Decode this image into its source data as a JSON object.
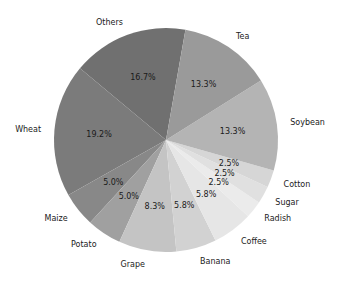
{
  "chart_data": {
    "type": "pie",
    "title": "",
    "start_angle_deg": 80,
    "direction": "counterclockwise",
    "center": [
      166,
      140
    ],
    "radius": 112,
    "slices": [
      {
        "label": "Others",
        "value": 16.7,
        "pct_label": "16.7%",
        "color": "#707070"
      },
      {
        "label": "Wheat",
        "value": 19.2,
        "pct_label": "19.2%",
        "color": "#7b7b7b"
      },
      {
        "label": "Maize",
        "value": 5.0,
        "pct_label": "5.0%",
        "color": "#888888"
      },
      {
        "label": "Potato",
        "value": 5.0,
        "pct_label": "5.0%",
        "color": "#a0a0a0"
      },
      {
        "label": "Grape",
        "value": 8.3,
        "pct_label": "8.3%",
        "color": "#c4c4c4"
      },
      {
        "label": "Banana",
        "value": 5.8,
        "pct_label": "5.8%",
        "color": "#d2d2d2"
      },
      {
        "label": "Coffee",
        "value": 5.8,
        "pct_label": "5.8%",
        "color": "#e6e6e6"
      },
      {
        "label": "Radish",
        "value": 2.5,
        "pct_label": "2.5%",
        "color": "#ebebeb"
      },
      {
        "label": "Sugar",
        "value": 2.5,
        "pct_label": "2.5%",
        "color": "#e0e0e0"
      },
      {
        "label": "Cotton",
        "value": 2.5,
        "pct_label": "2.5%",
        "color": "#d6d6d6"
      },
      {
        "label": "Soybean",
        "value": 13.3,
        "pct_label": "13.3%",
        "color": "#b4b4b4"
      },
      {
        "label": "Tea",
        "value": 13.3,
        "pct_label": "13.3%",
        "color": "#9a9a9a"
      }
    ],
    "categories": [
      "Others",
      "Wheat",
      "Maize",
      "Potato",
      "Grape",
      "Banana",
      "Coffee",
      "Radish",
      "Sugar",
      "Cotton",
      "Soybean",
      "Tea"
    ],
    "values": [
      16.7,
      19.2,
      5.0,
      5.0,
      8.3,
      5.8,
      5.8,
      2.5,
      2.5,
      2.5,
      13.3,
      13.3
    ],
    "legend": "none",
    "grid": false
  }
}
